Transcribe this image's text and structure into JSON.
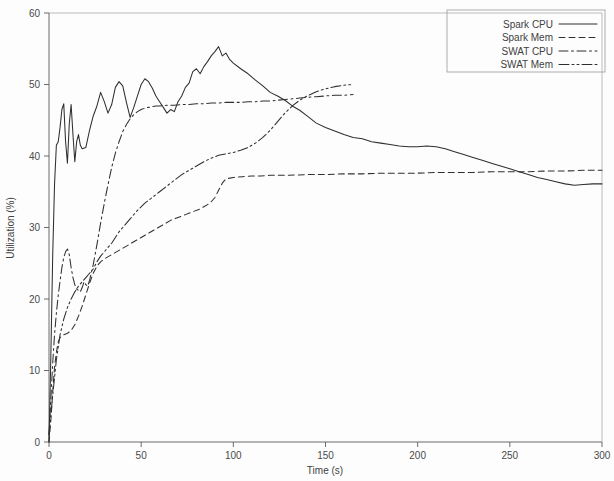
{
  "chart_data": {
    "type": "line",
    "title": "",
    "xlabel": "Time (s)",
    "ylabel": "Utilization (%)",
    "xlim": [
      0,
      300
    ],
    "ylim": [
      0,
      60
    ],
    "xticks": [
      0,
      50,
      100,
      150,
      200,
      250,
      300
    ],
    "yticks": [
      0,
      10,
      20,
      30,
      40,
      50,
      60
    ],
    "grid": false,
    "legend_position": "top-right",
    "legend_entries": [
      "Spark CPU",
      "Spark Mem",
      "SWAT CPU",
      "SWAT Mem"
    ],
    "series": [
      {
        "name": "Spark CPU",
        "dash": "solid",
        "x": [
          0,
          1,
          2,
          3,
          4,
          5,
          6,
          7,
          8,
          9,
          10,
          11,
          12,
          13,
          14,
          15,
          16,
          17,
          18,
          20,
          22,
          24,
          26,
          28,
          30,
          32,
          34,
          36,
          38,
          40,
          42,
          44,
          46,
          48,
          50,
          52,
          54,
          56,
          58,
          60,
          62,
          64,
          66,
          68,
          70,
          72,
          74,
          76,
          78,
          80,
          82,
          84,
          86,
          88,
          90,
          92,
          94,
          96,
          98,
          100,
          104,
          108,
          112,
          116,
          120,
          124,
          128,
          132,
          136,
          140,
          145,
          150,
          155,
          160,
          165,
          170,
          175,
          180,
          185,
          190,
          195,
          200,
          205,
          210,
          215,
          220,
          225,
          230,
          235,
          240,
          245,
          250,
          255,
          260,
          265,
          270,
          275,
          280,
          285,
          290,
          295,
          300
        ],
        "y": [
          0.0,
          12.0,
          26.0,
          36.0,
          41.5,
          42.0,
          44.0,
          46.5,
          47.3,
          42.0,
          39.0,
          44.5,
          47.2,
          43.0,
          39.2,
          42.0,
          43.0,
          41.5,
          41.0,
          41.2,
          43.6,
          45.6,
          47.0,
          48.9,
          47.6,
          46.0,
          47.2,
          49.6,
          50.4,
          49.8,
          47.5,
          45.4,
          46.8,
          48.4,
          50.0,
          50.8,
          50.4,
          49.5,
          48.4,
          47.6,
          46.8,
          46.0,
          46.5,
          46.2,
          47.6,
          48.4,
          49.6,
          50.2,
          51.8,
          52.2,
          51.5,
          52.5,
          53.2,
          54.0,
          54.6,
          55.3,
          54.0,
          54.4,
          53.5,
          53.0,
          52.2,
          51.5,
          50.6,
          49.8,
          48.9,
          48.4,
          47.8,
          47.0,
          46.4,
          45.6,
          44.6,
          44.0,
          43.5,
          43.0,
          42.6,
          42.4,
          42.0,
          41.8,
          41.6,
          41.4,
          41.3,
          41.3,
          41.4,
          41.3,
          41.0,
          40.6,
          40.2,
          39.8,
          39.4,
          39.0,
          38.6,
          38.2,
          37.8,
          37.4,
          37.0,
          36.7,
          36.4,
          36.1,
          35.9,
          36.0,
          36.1,
          36.1
        ]
      },
      {
        "name": "Spark Mem",
        "dash": "dashed",
        "x": [
          0,
          1,
          2,
          3,
          4,
          5,
          6,
          8,
          10,
          12,
          14,
          16,
          18,
          20,
          22,
          24,
          26,
          28,
          30,
          34,
          38,
          42,
          46,
          50,
          54,
          58,
          62,
          66,
          70,
          74,
          78,
          82,
          86,
          88,
          90,
          92,
          94,
          96,
          100,
          105,
          110,
          115,
          120,
          130,
          140,
          150,
          160,
          170,
          180,
          190,
          200,
          210,
          220,
          230,
          240,
          250,
          260,
          270,
          280,
          290,
          300
        ],
        "y": [
          0.0,
          3.0,
          7.0,
          10.5,
          12.5,
          14.0,
          14.6,
          15.0,
          15.2,
          15.6,
          16.4,
          17.6,
          19.0,
          20.6,
          22.2,
          23.6,
          24.6,
          25.2,
          25.6,
          26.2,
          26.8,
          27.4,
          28.0,
          28.6,
          29.2,
          29.8,
          30.4,
          31.0,
          31.4,
          31.8,
          32.2,
          32.6,
          33.2,
          33.6,
          34.2,
          35.2,
          36.2,
          36.8,
          37.0,
          37.1,
          37.2,
          37.2,
          37.3,
          37.3,
          37.4,
          37.4,
          37.5,
          37.5,
          37.6,
          37.6,
          37.6,
          37.7,
          37.7,
          37.7,
          37.8,
          37.8,
          37.8,
          37.9,
          37.9,
          38.0,
          38.0
        ]
      },
      {
        "name": "SWAT CPU",
        "dash": "dashdot",
        "x": [
          0,
          1,
          2,
          3,
          4,
          5,
          6,
          7,
          8,
          9,
          10,
          11,
          12,
          13,
          14,
          15,
          16,
          17,
          18,
          19,
          20,
          21,
          22,
          24,
          26,
          28,
          30,
          32,
          34,
          36,
          38,
          40,
          42,
          44,
          46,
          48,
          50,
          52,
          54,
          56,
          58,
          60,
          64,
          68,
          72,
          76,
          80,
          84,
          88,
          92,
          96,
          100,
          104,
          108,
          112,
          116,
          120,
          124,
          128,
          132,
          136,
          140,
          145,
          150,
          155,
          160,
          165
        ],
        "y": [
          1.0,
          6.0,
          11.0,
          15.0,
          18.0,
          20.5,
          22.5,
          24.4,
          25.8,
          26.6,
          27.0,
          26.2,
          24.4,
          23.0,
          22.0,
          21.4,
          21.2,
          21.0,
          21.6,
          22.4,
          22.0,
          21.8,
          22.6,
          24.8,
          27.6,
          30.6,
          33.4,
          36.0,
          38.4,
          40.4,
          42.0,
          43.4,
          44.4,
          45.2,
          45.8,
          46.2,
          46.5,
          46.7,
          46.8,
          46.9,
          47.0,
          47.0,
          47.1,
          47.1,
          47.2,
          47.2,
          47.3,
          47.3,
          47.4,
          47.4,
          47.5,
          47.5,
          47.5,
          47.6,
          47.6,
          47.7,
          47.7,
          47.8,
          47.9,
          48.0,
          48.1,
          48.2,
          48.3,
          48.4,
          48.5,
          48.5,
          48.6
        ]
      },
      {
        "name": "SWAT Mem",
        "dash": "dashdotdot",
        "x": [
          0,
          2,
          4,
          6,
          8,
          10,
          12,
          14,
          16,
          18,
          20,
          22,
          24,
          26,
          28,
          30,
          32,
          34,
          36,
          38,
          40,
          44,
          48,
          52,
          56,
          60,
          64,
          68,
          72,
          76,
          80,
          84,
          88,
          92,
          96,
          100,
          104,
          108,
          112,
          116,
          120,
          124,
          128,
          132,
          136,
          140,
          145,
          150,
          155,
          160,
          165
        ],
        "y": [
          1.0,
          6.5,
          11.5,
          15.0,
          17.2,
          18.8,
          20.0,
          21.0,
          21.8,
          22.4,
          23.0,
          23.6,
          24.2,
          25.2,
          26.0,
          26.6,
          27.2,
          27.8,
          28.6,
          29.4,
          30.0,
          31.2,
          32.4,
          33.4,
          34.2,
          35.0,
          35.8,
          36.6,
          37.4,
          38.0,
          38.6,
          39.2,
          39.7,
          40.1,
          40.3,
          40.5,
          40.8,
          41.2,
          41.8,
          42.6,
          43.6,
          44.8,
          46.0,
          47.0,
          47.8,
          48.4,
          49.0,
          49.4,
          49.7,
          49.9,
          50.0
        ]
      }
    ]
  },
  "axis": {
    "x_tick_labels": [
      "0",
      "50",
      "100",
      "150",
      "200",
      "250",
      "300"
    ],
    "y_tick_labels": [
      "0",
      "10",
      "20",
      "30",
      "40",
      "50",
      "60"
    ],
    "x_title": "Time (s)",
    "y_title": "Utilization (%)"
  },
  "legend": {
    "items": [
      {
        "label": "Spark CPU",
        "style": "solid"
      },
      {
        "label": "Spark Mem",
        "style": "dashed"
      },
      {
        "label": "SWAT CPU",
        "style": "dashdot"
      },
      {
        "label": "SWAT Mem",
        "style": "dashdotdot"
      }
    ]
  },
  "colors": {
    "line": "#2f2f2f",
    "axis": "#5a5a5a",
    "text": "#3f3f3f",
    "background": "#fdfdfd"
  }
}
